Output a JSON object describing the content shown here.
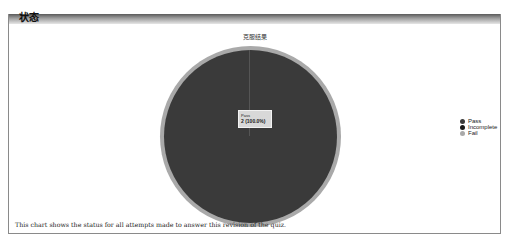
{
  "panel": {
    "title": "状态"
  },
  "chart_data": {
    "type": "pie",
    "title": "克服结果",
    "categories": [
      "Pass",
      "Incomplete",
      "Fail"
    ],
    "values": [
      2,
      0,
      0
    ],
    "percentages": [
      100.0,
      0.0,
      0.0
    ],
    "colors": [
      "#3a3a3a",
      "#1a1a1a",
      "#a9a9a9"
    ],
    "legend_position": "right",
    "tooltip": {
      "label": "Pass",
      "value": "2 (100.0%)"
    }
  },
  "legend": {
    "items": [
      {
        "label": "Pass",
        "color": "#3a3a3a"
      },
      {
        "label": "Incomplete",
        "color": "#1a1a1a"
      },
      {
        "label": "Fail",
        "color": "#a9a9a9"
      }
    ]
  },
  "caption": "This chart shows the status for all attempts made to answer this revision of the quiz."
}
